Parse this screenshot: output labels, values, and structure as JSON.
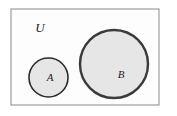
{
  "figure": {
    "kind": "venn-diagram",
    "background_color": "#ffffff"
  },
  "universe": {
    "label": "U",
    "border_color": "#8a8a8a",
    "fill_color": "#fdfdfd",
    "x": 11,
    "y": 9,
    "width": 148,
    "height": 96,
    "label_x": 40,
    "label_y": 29
  },
  "sets": [
    {
      "id": "A",
      "label": "A",
      "cx": 48.5,
      "cy": 77.5,
      "r": 19.5,
      "fill_color": "#e6e6e6",
      "stroke_color": "#2b2b2b",
      "stroke_width": 1.6,
      "label_x": 50,
      "label_y": 78
    },
    {
      "id": "B",
      "label": "B",
      "cx": 114,
      "cy": 64,
      "r": 34,
      "fill_color": "#e6e6e6",
      "stroke_color": "#3a3a3a",
      "stroke_width": 2.4,
      "label_x": 121,
      "label_y": 75
    }
  ],
  "relations": {
    "a_and_b": "disjoint",
    "a_in_u": true,
    "b_in_u": true
  }
}
